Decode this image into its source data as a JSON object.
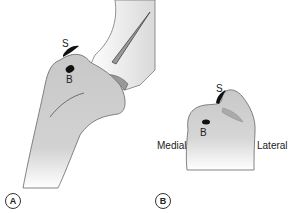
{
  "figure": {
    "panels": [
      {
        "id": "A",
        "label": "A",
        "markers": {
          "s": "S",
          "b": "B"
        }
      },
      {
        "id": "B",
        "label": "B",
        "markers": {
          "s": "S",
          "b": "B"
        },
        "side_labels": {
          "medial": "Medial",
          "lateral": "Lateral"
        }
      }
    ]
  },
  "colors": {
    "bone": "#cfcfcf",
    "outline": "#555555",
    "marker": "#111111"
  }
}
